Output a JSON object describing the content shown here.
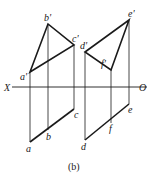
{
  "figure": {
    "caption": "(b)",
    "axis": {
      "left_label": "X",
      "right_label": "O",
      "y": 87,
      "x1": 12,
      "x2": 147
    },
    "line_color": "#1a1a1a",
    "triangle_abc": {
      "front_view": {
        "a1": {
          "label": "a'",
          "x": 30,
          "y": 72
        },
        "b1": {
          "label": "b'",
          "x": 48,
          "y": 24
        },
        "c1": {
          "label": "c'",
          "x": 74,
          "y": 45
        }
      },
      "top_view": {
        "a": {
          "label": "a",
          "x": 30,
          "y": 142
        },
        "b": {
          "label": "b",
          "x": 48,
          "y": 130
        },
        "c": {
          "label": "c",
          "x": 74,
          "y": 109
        }
      }
    },
    "triangle_def": {
      "front_view": {
        "d1": {
          "label": "d'",
          "x": 85,
          "y": 52
        },
        "e1": {
          "label": "e'",
          "x": 129,
          "y": 20
        },
        "f1": {
          "label": "f'",
          "x": 111,
          "y": 70
        }
      },
      "top_view": {
        "d": {
          "label": "d",
          "x": 85,
          "y": 140
        },
        "e": {
          "label": "e",
          "x": 129,
          "y": 104
        },
        "f": {
          "label": "f",
          "x": 111,
          "y": 123
        }
      }
    }
  }
}
